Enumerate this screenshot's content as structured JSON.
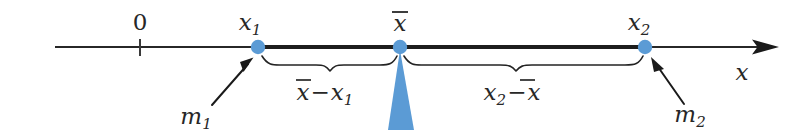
{
  "figure": {
    "background_color": "#ffffff",
    "ink_color": "#272727",
    "accent_color": "#5b9bd5"
  },
  "axis": {
    "label": "x",
    "origin_label": "0",
    "arrow_direction": "right",
    "line_y": 47
  },
  "points": [
    {
      "id": "x1",
      "label": "x",
      "subscript": "1",
      "x": 258,
      "marker": "dot",
      "color": "#5b9bd5"
    },
    {
      "id": "xbar",
      "label": "x",
      "overbar": true,
      "x": 400,
      "marker": "dot",
      "color": "#5b9bd5"
    },
    {
      "id": "x2",
      "label": "x",
      "subscript": "2",
      "x": 645,
      "marker": "dot",
      "color": "#5b9bd5"
    }
  ],
  "masses": [
    {
      "id": "m1",
      "label": "m",
      "subscript": "1",
      "points_to": "x1",
      "text_x": 196,
      "text_y": 124
    },
    {
      "id": "m2",
      "label": "m",
      "subscript": "2",
      "points_to": "x2",
      "text_x": 690,
      "text_y": 122
    }
  ],
  "braces": [
    {
      "id": "left-brace",
      "from": "x1",
      "to": "xbar",
      "label_lead": "x",
      "label_lead_overbar": true,
      "label_operator": "−",
      "label_trail": "x",
      "label_trail_subscript": "1",
      "label_x": 325,
      "label_y": 100
    },
    {
      "id": "right-brace",
      "from": "xbar",
      "to": "x2",
      "label_lead": "x",
      "label_lead_subscript": "2",
      "label_operator": "−",
      "label_trail": "x",
      "label_trail_overbar": true,
      "label_x": 512,
      "label_y": 100
    }
  ],
  "fulcrum": {
    "id": "fulcrum",
    "shape": "triangle",
    "apex_x": 400,
    "apex_y": 50,
    "base_left_x": 388,
    "base_right_x": 414,
    "base_y": 130,
    "color": "#5b9bd5"
  },
  "labels": {
    "axis_variable": "x",
    "origin": "0",
    "x1": "x₁",
    "xbar": "x̄",
    "x2": "x₂",
    "m1": "m₁",
    "m2": "m₂",
    "left_distance": "x̄−x₁",
    "right_distance": "x₂−x̄"
  }
}
